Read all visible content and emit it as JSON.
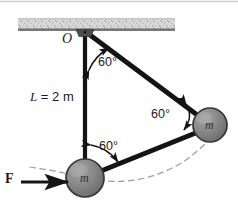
{
  "figure": {
    "background_color": "#ffffff"
  },
  "ceiling": {
    "name": "hatched-ceiling",
    "texture": "speckled-gray",
    "fill_color": "#d4d4d4",
    "edge_color": "#6f6f6f",
    "x": 18,
    "y": 18,
    "width": 157,
    "height": 12
  },
  "pivot": {
    "label": "O",
    "name": "pivot-point-O",
    "x": 85,
    "y": 31,
    "bracket_color": "#4a4a4a"
  },
  "rods": [
    {
      "name": "rod-vertical",
      "from": [
        85,
        32
      ],
      "to": [
        85,
        178
      ],
      "color": "#141414",
      "width": 4.2
    },
    {
      "name": "rod-diagonal-upper",
      "from": [
        86,
        33
      ],
      "to": [
        207,
        123
      ],
      "color": "#141414",
      "width": 4.6
    },
    {
      "name": "rod-diagonal-lower",
      "from": [
        86,
        177
      ],
      "to": [
        207,
        127
      ],
      "color": "#141414",
      "width": 4.6
    }
  ],
  "masses": [
    {
      "name": "mass-right",
      "label": "m",
      "cx": 210,
      "cy": 125,
      "r": 17,
      "fill_color": "#8a8a8a",
      "stroke_color": "#3a3a3a"
    },
    {
      "name": "mass-bottom",
      "label": "m",
      "cx": 85,
      "cy": 178,
      "r": 19,
      "fill_color": "#8a8a8a",
      "stroke_color": "#3a3a3a"
    }
  ],
  "length_label": {
    "name": "rod-length-label",
    "symbol": "L",
    "equals": " = ",
    "value": "2 m",
    "full_text": "L = 2 m",
    "x": 30,
    "y": 97
  },
  "angles": [
    {
      "name": "angle-top",
      "value": "60",
      "unit": "°",
      "label": "60°",
      "x": 98,
      "y": 62,
      "arc_color": "#141414"
    },
    {
      "name": "angle-right",
      "value": "60",
      "unit": "°",
      "label": "60°",
      "x": 151,
      "y": 113,
      "arc_color": "#141414"
    },
    {
      "name": "angle-bottom",
      "value": "60",
      "unit": "°",
      "label": "60°",
      "x": 98,
      "y": 145,
      "arc_color": "#141414"
    }
  ],
  "force": {
    "name": "force-vector-F",
    "label": "F",
    "label_x": 5,
    "label_y": 178,
    "arrow_from": [
      20,
      182
    ],
    "arrow_to": [
      66,
      182
    ],
    "color": "#141414"
  },
  "swing_arc": {
    "name": "swing-path-arc",
    "style": "dashed",
    "color": "#9a9a9a",
    "description": "dashed arc showing swing path of mass from bottom position to right position"
  },
  "top_border": {
    "name": "top-edge-line",
    "color": "#c9c9c9"
  }
}
